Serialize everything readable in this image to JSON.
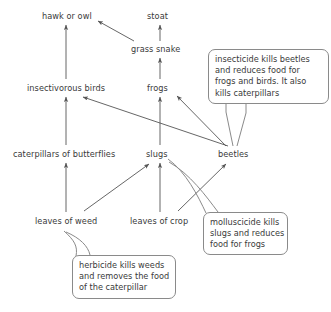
{
  "diagram": {
    "canvas": {
      "width": 331,
      "height": 312
    },
    "stroke_color": "#555555",
    "text_color": "#3a3a3a",
    "box_border_color": "#8a8a8a",
    "background": "#ffffff",
    "nodes": [
      {
        "id": "hawk_or_owl",
        "label": "hawk or owl",
        "x": 42,
        "y": 11
      },
      {
        "id": "stoat",
        "label": "stoat",
        "x": 147,
        "y": 11
      },
      {
        "id": "grass_snake",
        "label": "grass snake",
        "x": 131,
        "y": 44
      },
      {
        "id": "insectivorous_birds",
        "label": "insectivorous birds",
        "x": 27,
        "y": 83
      },
      {
        "id": "frogs",
        "label": "frogs",
        "x": 147,
        "y": 83
      },
      {
        "id": "caterpillars_of_butterflies",
        "label": "caterpillars of butterflies",
        "x": 13,
        "y": 149
      },
      {
        "id": "slugs",
        "label": "slugs",
        "x": 146,
        "y": 149
      },
      {
        "id": "beetles",
        "label": "beetles",
        "x": 218,
        "y": 149
      },
      {
        "id": "leaves_of_weed",
        "label": "leaves of weed",
        "x": 35,
        "y": 216
      },
      {
        "id": "leaves_of_crop",
        "label": "leaves of crop",
        "x": 130,
        "y": 216
      }
    ],
    "callouts": [
      {
        "id": "insecticide_note",
        "lines": [
          "insecticide kills beetles",
          "and reduces food for",
          "frogs and birds. It also",
          "kills caterpillars"
        ],
        "x": 208,
        "y": 49,
        "width": 121,
        "height": 55,
        "points_to": "beetles"
      },
      {
        "id": "molluscicide_note",
        "lines": [
          "molluscicide kills",
          "slugs and reduces",
          "food for frogs"
        ],
        "x": 203,
        "y": 212,
        "width": 85,
        "height": 43,
        "points_to": "slugs"
      },
      {
        "id": "herbicide_note",
        "lines": [
          "herbicide kills weeds",
          "and removes the food",
          "of the caterpillar"
        ],
        "x": 72,
        "y": 255,
        "width": 104,
        "height": 44,
        "points_to": "leaves_of_weed"
      }
    ],
    "edges": [
      {
        "from": "insectivorous_birds",
        "to": "hawk_or_owl"
      },
      {
        "from": "grass_snake",
        "to": "hawk_or_owl"
      },
      {
        "from": "grass_snake",
        "to": "stoat"
      },
      {
        "from": "frogs",
        "to": "grass_snake"
      },
      {
        "from": "caterpillars_of_butterflies",
        "to": "insectivorous_birds"
      },
      {
        "from": "beetles",
        "to": "insectivorous_birds"
      },
      {
        "from": "slugs",
        "to": "frogs"
      },
      {
        "from": "beetles",
        "to": "frogs"
      },
      {
        "from": "leaves_of_weed",
        "to": "caterpillars_of_butterflies"
      },
      {
        "from": "leaves_of_weed",
        "to": "slugs"
      },
      {
        "from": "leaves_of_crop",
        "to": "slugs"
      },
      {
        "from": "leaves_of_crop",
        "to": "beetles"
      }
    ]
  }
}
